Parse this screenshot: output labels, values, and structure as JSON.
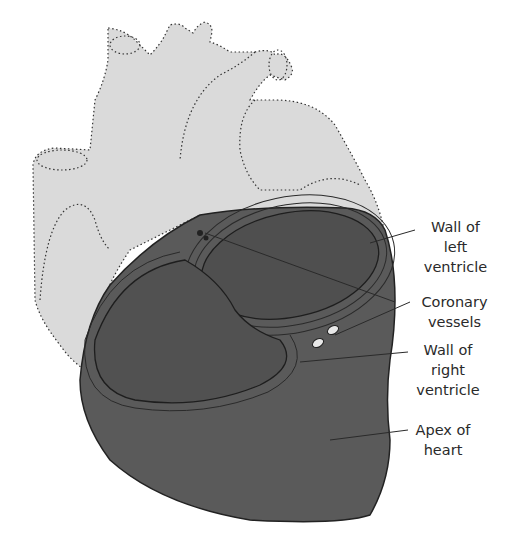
{
  "colors": {
    "background": "#ffffff",
    "heart_upper_fill": "#dadada",
    "ventricle_fill": "#5a5a5a",
    "ventricle_wall_lines": "#2a2a2a",
    "outline_dotted": "#333333",
    "label_text": "#2a2a2a"
  },
  "labels": [
    {
      "id": "wall-left-ventricle",
      "text": "Wall of\nleft\nventricle"
    },
    {
      "id": "coronary-vessels",
      "text": "Coronary\nvessels"
    },
    {
      "id": "wall-right-ventricle",
      "text": "Wall of\nright\nventricle"
    },
    {
      "id": "apex-of-heart",
      "text": "Apex of\nheart"
    }
  ]
}
